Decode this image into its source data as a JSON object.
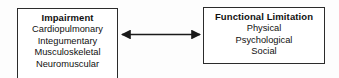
{
  "diagram": {
    "type": "two-node-bidirectional-flow",
    "background_color": "#fdfdfd",
    "border_color": "#2b2b2b",
    "text_color": "#101010",
    "nodes": [
      {
        "id": "impairment",
        "title": "Impairment",
        "items": [
          "Cardiopulmonary",
          "Integumentary",
          "Musculoskeletal",
          "Neuromuscular"
        ]
      },
      {
        "id": "functional-limitation",
        "title": "Functional Limitation",
        "items": [
          "Physical",
          "Psychological",
          "Social"
        ]
      }
    ],
    "connector": {
      "icon": "double-headed-arrow-icon",
      "direction": "bidirectional",
      "color": "#1a1a1a"
    }
  }
}
